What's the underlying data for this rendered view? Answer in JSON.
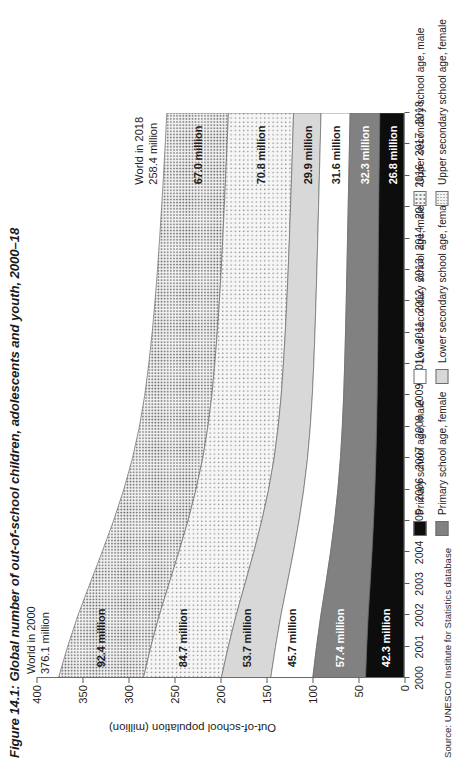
{
  "figure": {
    "title": "Figure 14.1: Global number of out-of-school children, adolescents and youth, 2000–18",
    "source": "Source: UNESCO Institute for Statistics database"
  },
  "callouts": {
    "start": {
      "line1": "World in 2000",
      "line2": "376.1 million"
    },
    "end": {
      "line1": "World in 2018",
      "line2": "258.4 million"
    }
  },
  "legend": {
    "items": [
      {
        "label": "Primary school age, male",
        "swatch": "f-prim-m"
      },
      {
        "label": "Primary school age, female",
        "swatch": "f-prim-f"
      },
      {
        "label": "Lower secondary school age, male",
        "swatch": "f-low-m"
      },
      {
        "label": "Lower secondary school age, female",
        "swatch": "f-low-f"
      },
      {
        "label": "Upper secondary school age, male",
        "swatch": "f-up-m"
      },
      {
        "label": "Upper secondary school age, female",
        "swatch": "f-up-f"
      }
    ]
  },
  "chart_data": {
    "type": "area",
    "title": "Figure 14.1: Global number of out-of-school children, adolescents and youth, 2000–18",
    "xlabel": "",
    "ylabel": "Out-of-school population (million)",
    "ylim": [
      0,
      400
    ],
    "yticks": [
      0,
      50,
      100,
      150,
      200,
      250,
      300,
      350,
      400
    ],
    "grid": false,
    "legend_position": "bottom",
    "stacked": true,
    "x": [
      2000,
      2001,
      2002,
      2003,
      2004,
      2005,
      2006,
      2007,
      2008,
      2009,
      2010,
      2011,
      2012,
      2013,
      2014,
      2015,
      2016,
      2017,
      2018
    ],
    "series": [
      {
        "name": "Primary school age, male",
        "start_label": "42.3 million",
        "end_label": "26.8 million",
        "values": [
          42.3,
          41.0,
          39.4,
          37.3,
          35.3,
          33.6,
          32.2,
          31.1,
          30.3,
          29.7,
          29.3,
          29.0,
          28.8,
          28.6,
          28.3,
          28.0,
          27.6,
          27.2,
          26.8
        ]
      },
      {
        "name": "Primary school age, female",
        "start_label": "57.4 million",
        "end_label": "32.3 million",
        "values": [
          57.4,
          54.6,
          51.5,
          48.2,
          45.1,
          42.4,
          40.2,
          38.5,
          37.3,
          36.4,
          35.7,
          35.1,
          34.5,
          34.0,
          33.6,
          33.2,
          32.9,
          32.6,
          32.3
        ]
      },
      {
        "name": "Lower secondary school age, male",
        "start_label": "45.7 million",
        "end_label": "31.6 million",
        "values": [
          45.7,
          44.6,
          43.4,
          42.0,
          40.4,
          38.7,
          37.1,
          35.8,
          34.8,
          34.1,
          33.6,
          33.2,
          32.9,
          32.6,
          32.4,
          32.2,
          32.0,
          31.8,
          31.6
        ]
      },
      {
        "name": "Lower secondary school age, female",
        "start_label": "53.7 million",
        "end_label": "29.9 million",
        "values": [
          53.7,
          51.3,
          48.7,
          45.9,
          43.1,
          40.5,
          38.2,
          36.3,
          34.9,
          33.8,
          33.0,
          32.3,
          31.7,
          31.2,
          30.8,
          30.5,
          30.2,
          30.0,
          29.9
        ]
      },
      {
        "name": "Upper secondary school age, male",
        "start_label": "84.7 million",
        "end_label": "70.8 million",
        "values": [
          84.7,
          84.2,
          83.5,
          82.6,
          81.5,
          80.2,
          78.9,
          77.6,
          76.4,
          75.4,
          74.6,
          73.9,
          73.3,
          72.8,
          72.4,
          72.0,
          71.6,
          71.2,
          70.8
        ]
      },
      {
        "name": "Upper secondary school age, female",
        "start_label": "92.4 million",
        "end_label": "67.0 million",
        "values": [
          92.4,
          90.5,
          88.4,
          86.0,
          83.5,
          81.0,
          78.6,
          76.4,
          74.5,
          73.0,
          71.8,
          70.8,
          70.0,
          69.3,
          68.7,
          68.1,
          67.7,
          67.3,
          67.0
        ]
      }
    ],
    "totals": {
      "2000": 376.1,
      "2018": 258.4
    }
  }
}
